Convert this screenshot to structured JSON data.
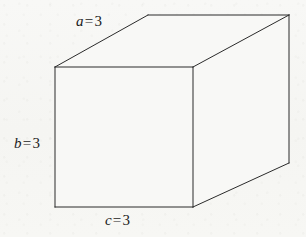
{
  "figure": {
    "kind": "rectangular-prism-diagram",
    "shape_name": "cuboid",
    "stroke_color": "#2b2b2b",
    "face_color": "#f8f8f6",
    "background_color": "#f7f7f5",
    "geometry": {
      "front_top_left": [
        55,
        67
      ],
      "front_top_right": [
        193,
        67
      ],
      "front_bottom_right": [
        193,
        207
      ],
      "front_bottom_left": [
        55,
        207
      ],
      "back_top_left": [
        148,
        15
      ],
      "back_top_right": [
        289,
        15
      ],
      "back_bottom_right": [
        289,
        163
      ]
    },
    "labels": [
      {
        "id": "a",
        "name": "depth-label",
        "variable": "a",
        "equals": "=",
        "value": "3",
        "text": "a = 3",
        "edge": "top-back-slant"
      },
      {
        "id": "b",
        "name": "height-label",
        "variable": "b",
        "equals": "=",
        "value": "3",
        "text": "b = 3",
        "edge": "front-left-vertical"
      },
      {
        "id": "c",
        "name": "width-label",
        "variable": "c",
        "equals": "=",
        "value": "3",
        "text": "c = 3",
        "edge": "front-bottom-horizontal"
      }
    ]
  }
}
